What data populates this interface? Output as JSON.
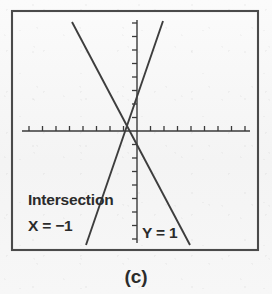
{
  "figure": {
    "caption": "(c)",
    "frame": {
      "x": 12,
      "y": 11,
      "width": 246,
      "height": 239
    }
  },
  "annotations": {
    "intersection_label": "Intersection",
    "x_value_label": "X = −1",
    "y_value_label": "Y = 1"
  },
  "colors": {
    "ink": "#3d3d3d",
    "frame": "#4a4a4a",
    "paper": "#f7f7f7",
    "text": "#2b2b2b"
  },
  "chart_data": {
    "type": "line",
    "title": "(c)",
    "xlabel": "",
    "ylabel": "",
    "grid": false,
    "legend": "none",
    "axes": {
      "x_axis_pixel_y": 131,
      "y_axis_pixel_x": 137,
      "x_axis_span_px": [
        22,
        250
      ],
      "y_axis_span_px": [
        20,
        243
      ],
      "x_tick_count_left": 8,
      "x_tick_count_right": 9,
      "y_tick_count_above": 8,
      "y_tick_count_below": 8,
      "tick_spacing_px": 13.5,
      "tick_length_px": 5,
      "x_ticks_drawn": "above-axis",
      "y_ticks_drawn": "left-of-axis"
    },
    "intersection": {
      "x": -1,
      "y": 1,
      "pixel": [
        126,
        124
      ]
    },
    "series": [
      {
        "name": "rising-line",
        "slope": "positive",
        "endpoints_px": [
          [
            86,
            245
          ],
          [
            163,
            21
          ]
        ],
        "points": [
          {
            "x": -4.5,
            "y": -8.4
          },
          {
            "x": 1.9,
            "y": 8.1
          }
        ]
      },
      {
        "name": "falling-line",
        "slope": "negative",
        "endpoints_px": [
          [
            72,
            22
          ],
          [
            190,
            245
          ]
        ],
        "points": [
          {
            "x": -5.6,
            "y": 8.1
          },
          {
            "x": 4.2,
            "y": -8.4
          }
        ]
      }
    ]
  }
}
